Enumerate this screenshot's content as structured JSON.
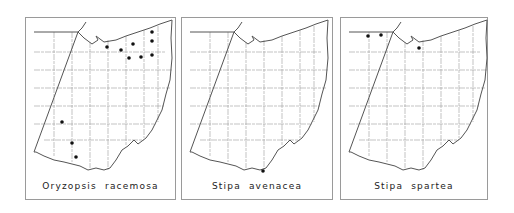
{
  "figure": {
    "panels": [
      {
        "species": "Oryzopsis racemosa",
        "frame": {
          "left": 25,
          "width": 151
        },
        "records": [
          [
            81,
            29
          ],
          [
            95,
            32
          ],
          [
            103,
            40
          ],
          [
            107,
            26
          ],
          [
            115,
            39
          ],
          [
            126,
            14
          ],
          [
            126,
            23
          ],
          [
            126,
            37
          ],
          [
            36,
            104
          ],
          [
            46,
            125
          ],
          [
            50,
            139
          ]
        ]
      },
      {
        "species": "Stipa avenacea",
        "frame": {
          "left": 181,
          "width": 152
        },
        "records": [
          [
            81,
            153
          ]
        ]
      },
      {
        "species": "Stipa spartea",
        "frame": {
          "left": 340,
          "width": 148
        },
        "records": [
          [
            27,
            18
          ],
          [
            40,
            17
          ],
          [
            78,
            30
          ]
        ]
      }
    ],
    "colors": {
      "outline": "#555555",
      "county_lines": "#9a9a9a",
      "dot": "#111111"
    }
  }
}
